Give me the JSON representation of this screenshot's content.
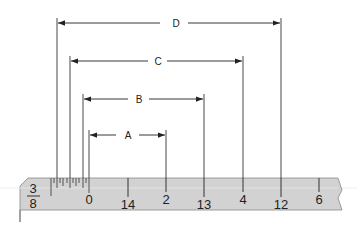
{
  "diagram": {
    "ruler": {
      "fraction": {
        "numerator": "3",
        "denominator": "8"
      },
      "scale_labels": [
        {
          "text": "0",
          "x": 89
        },
        {
          "text": "14",
          "x": 128
        },
        {
          "text": "2",
          "x": 166
        },
        {
          "text": "13",
          "x": 204
        },
        {
          "text": "4",
          "x": 243
        },
        {
          "text": "12",
          "x": 281
        },
        {
          "text": "6",
          "x": 319
        }
      ],
      "fill_color": "#d2d2d2"
    },
    "dimensions": [
      {
        "label": "D",
        "x1": 57,
        "x2": 281,
        "y": 23
      },
      {
        "label": "C",
        "x1": 70,
        "x2": 243,
        "y": 61
      },
      {
        "label": "B",
        "x1": 83,
        "x2": 204,
        "y": 99
      },
      {
        "label": "A",
        "x1": 89,
        "x2": 166,
        "y": 135
      }
    ]
  }
}
